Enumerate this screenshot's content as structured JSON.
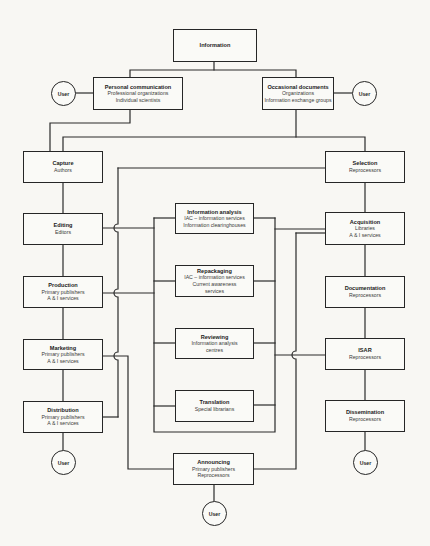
{
  "nodes": {
    "information": {
      "title": "Information"
    },
    "personal_communication": {
      "title": "Personal communication",
      "lines": [
        "Professional organizations",
        "Individual scientists"
      ]
    },
    "occasional_documents": {
      "title": "Occasional documents",
      "lines": [
        "Organizations",
        "Information exchange groups"
      ]
    },
    "capture": {
      "title": "Capture",
      "lines": [
        "Authors"
      ]
    },
    "editing": {
      "title": "Editing",
      "lines": [
        "Editors"
      ]
    },
    "production": {
      "title": "Production",
      "lines": [
        "Primary publishers",
        "A & I services"
      ]
    },
    "marketing": {
      "title": "Marketing",
      "lines": [
        "Primary publishers",
        "A & I services"
      ]
    },
    "distribution": {
      "title": "Distribution",
      "lines": [
        "Primary publishers",
        "A & I services"
      ]
    },
    "information_analysis": {
      "title": "Information analysis",
      "lines": [
        "IAC – information services",
        "Information clearinghouses"
      ]
    },
    "repackaging": {
      "title": "Repackaging",
      "lines": [
        "IAC – information services",
        "Current awareness",
        "services"
      ]
    },
    "reviewing": {
      "title": "Reviewing",
      "lines": [
        "Information analysis",
        "centres"
      ]
    },
    "translation": {
      "title": "Translation",
      "lines": [
        "Special librarians"
      ]
    },
    "announcing": {
      "title": "Announcing",
      "lines": [
        "Primary publishers",
        "Reprocessors"
      ]
    },
    "selection": {
      "title": "Selection",
      "lines": [
        "Reprocessors"
      ]
    },
    "acquisition": {
      "title": "Acquisition",
      "lines": [
        "Libraries",
        "A & I services"
      ]
    },
    "documentation": {
      "title": "Documentation",
      "lines": [
        "Reprocessors"
      ]
    },
    "isar": {
      "title": "ISAR",
      "lines": [
        "Reprocessors"
      ]
    },
    "dissemination": {
      "title": "Dissemination",
      "lines": [
        "Reprocessors"
      ]
    }
  },
  "users": {
    "personal_communication": "User",
    "occasional_documents": "User",
    "distribution": "User",
    "dissemination": "User",
    "announcing": "User"
  },
  "colors": {
    "line": "#2a2a2a",
    "background": "#f8f7f3",
    "box_fill": "#fafaf7"
  }
}
